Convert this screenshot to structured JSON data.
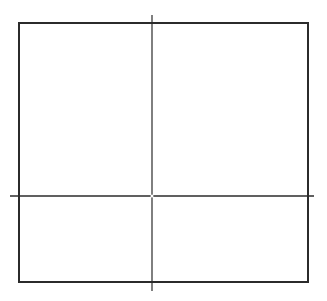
{
  "diagram": {
    "background": "#ffffff",
    "stroke_color": "#2b2b2b",
    "rectangle": {
      "x": 19,
      "y": 23,
      "width": 289,
      "height": 259,
      "stroke_width": 2
    },
    "vertical_line": {
      "x": 152,
      "y1": 15,
      "y2": 291,
      "stroke_width": 1.2
    },
    "horizontal_line": {
      "y": 196,
      "x1": 10,
      "x2": 314,
      "stroke_width": 1.6
    },
    "intersection": {
      "x": 152,
      "y": 196,
      "gap_radius": 1.5
    }
  }
}
